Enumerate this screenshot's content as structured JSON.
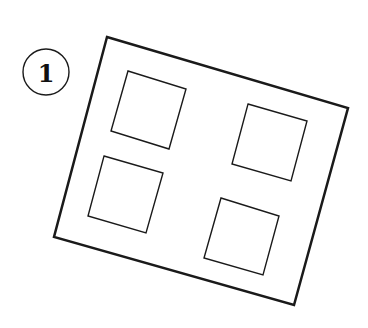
{
  "figure": {
    "label": "1",
    "stroke_color": "#1a1a1a",
    "background": "#ffffff",
    "badge": {
      "cx": 46,
      "cy": 72,
      "r": 23
    },
    "outer_frame": {
      "points": "107,37 348,108 294,305 54,237",
      "stroke_width": 2.5
    },
    "inner_squares": [
      {
        "name": "top-left",
        "points": "128,71 186,89 169,149 111,131"
      },
      {
        "name": "top-right",
        "points": "248,104 307,121 291,181 232,164"
      },
      {
        "name": "bottom-left",
        "points": "104,156 163,173 146,233 88,216"
      },
      {
        "name": "bottom-right",
        "points": "221,198 279,216 263,275 204,258"
      }
    ],
    "inner_stroke_width": 1.4
  }
}
